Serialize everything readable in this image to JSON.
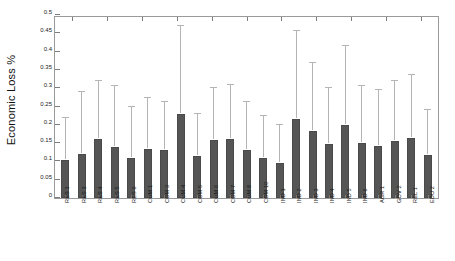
{
  "chart_data": {
    "type": "bar",
    "title": "",
    "xlabel": "",
    "ylabel": "Economic Loss %",
    "ylim": [
      0,
      0.5
    ],
    "ytick_labels": [
      "0",
      "0.05",
      "0.1",
      "0.15",
      "0.2",
      "0.25",
      "0.3",
      "0.35",
      "0.4",
      "0.45",
      "0.5"
    ],
    "ytick_values": [
      0,
      0.05,
      0.1,
      0.15,
      0.2,
      0.25,
      0.3,
      0.35,
      0.4,
      0.45,
      0.5
    ],
    "grid": false,
    "legend": "none",
    "error_bars": "upper-only",
    "bar_color": "#555555",
    "error_bar_color": "#b4b4b4",
    "categories": [
      "RES 1",
      "RES 3",
      "RES 4",
      "RES 5",
      "RES 6",
      "COM 1",
      "COM 3",
      "COM 4",
      "COM 5",
      "COM 6",
      "COM 7",
      "COM 8",
      "COM 10",
      "IND 1",
      "IND 2",
      "IND 3",
      "IND 4",
      "IND 5",
      "IND 6",
      "AGR 1",
      "GOV 2",
      "REL 1",
      "EDU 2"
    ],
    "values": [
      0.104,
      0.12,
      0.16,
      0.14,
      0.11,
      0.135,
      0.13,
      0.23,
      0.115,
      0.158,
      0.16,
      0.132,
      0.11,
      0.096,
      0.215,
      0.182,
      0.148,
      0.2,
      0.15,
      0.143,
      0.155,
      0.165,
      0.118
    ],
    "error_upper": [
      0.218,
      0.29,
      0.32,
      0.305,
      0.25,
      0.272,
      0.262,
      0.47,
      0.23,
      0.3,
      0.308,
      0.262,
      0.225,
      0.2,
      0.455,
      0.37,
      0.3,
      0.415,
      0.305,
      0.295,
      0.32,
      0.335,
      0.24
    ]
  }
}
